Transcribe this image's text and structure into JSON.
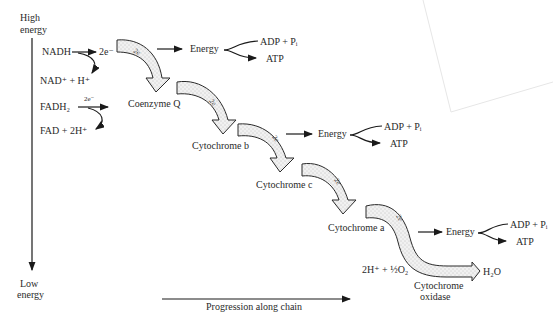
{
  "axes": {
    "y_top_label_line1": "High",
    "y_top_label_line2": "energy",
    "y_bottom_label_line1": "Low",
    "y_bottom_label_line2": "energy",
    "x_label": "Progression along chain"
  },
  "inputs": {
    "nadh": "NADH",
    "nadh_electrons": "2e⁻",
    "nadh_product": "NAD⁺ + H⁺",
    "fadh2": "FADH₂",
    "fadh2_electrons": "2e⁻",
    "fadh2_product": "FAD + 2H⁺"
  },
  "carriers": [
    {
      "name": "Coenzyme Q"
    },
    {
      "name": "Cytochrome b"
    },
    {
      "name": "Cytochrome c"
    },
    {
      "name": "Cytochrome a"
    },
    {
      "name_line1": "Cytochrome",
      "name_line2": "oxidase"
    }
  ],
  "arrow_label": "2e",
  "energy_steps": [
    {
      "energy": "Energy",
      "reactant": "ADP + Pᵢ",
      "product": "ATP"
    },
    {
      "energy": "Energy",
      "reactant": "ADP + Pᵢ",
      "product": "ATP"
    },
    {
      "energy": "Energy",
      "reactant": "ADP + Pᵢ",
      "product": "ATP"
    }
  ],
  "final_reaction": {
    "reactant": "2H⁺ + ½O₂",
    "product": "H₂O"
  }
}
